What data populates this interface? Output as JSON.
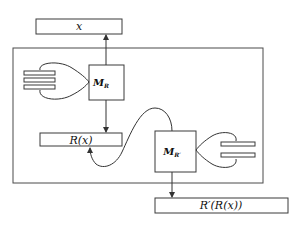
{
  "diagram": {
    "input_box": {
      "label": "x"
    },
    "machine_r": {
      "label": "M",
      "subscript": "R"
    },
    "intermediate_box": {
      "label": "R(x)"
    },
    "machine_r_prime": {
      "label": "M",
      "subscript": "R′"
    },
    "output_box": {
      "label": "R′(R(x))"
    },
    "tape_r": {
      "bars": 3
    },
    "tape_r_prime": {
      "bars": 2
    }
  }
}
